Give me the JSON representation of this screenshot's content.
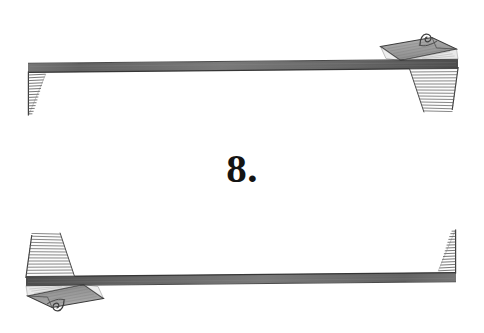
{
  "page": {
    "kind": "scanned-book-page-ornament",
    "width": 484,
    "height": 333,
    "background_color": "#ffffff",
    "ink_color": "#4a4a4a",
    "ink_color_dark": "#2e2e2e",
    "text_color": "#141414"
  },
  "chapter": {
    "number_label": "8.",
    "number_value": "8",
    "punctuation": "."
  },
  "ornaments": {
    "top_rule": {
      "name": "banner-rule-top",
      "description": "engraved horizontal ribbon rule with hatched tapering tail at left end and folded ribbon end with curl at right end",
      "left_x": 28,
      "right_x": 458,
      "baseline_y": 72,
      "fold_side": "right",
      "curl": true,
      "hatch_lines": 16
    },
    "bottom_rule": {
      "name": "banner-rule-bottom",
      "description": "engraved horizontal ribbon rule rotated 180 degrees, hatched tapering tail at right end and folded ribbon end with curl at left end",
      "left_x": 26,
      "right_x": 457,
      "baseline_y": 277,
      "fold_side": "left",
      "curl": true,
      "hatch_lines": 16
    }
  }
}
